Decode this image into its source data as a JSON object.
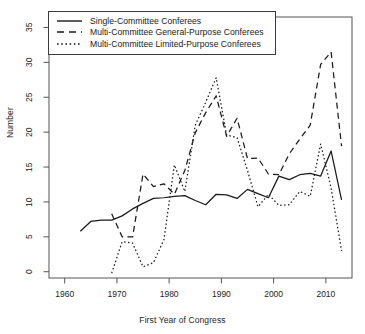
{
  "figure": {
    "title": "",
    "top_partial_text": "",
    "background_color": "#ffffff",
    "line_color": "#1a1a1a"
  },
  "axes": {
    "xlabel": "First Year of Congress",
    "ylabel": "Number",
    "xticks": [
      1960,
      1970,
      1980,
      1990,
      2000,
      2010
    ],
    "xtick_labels": [
      "1960",
      "1970",
      "1980",
      "1990",
      "2000",
      "2010"
    ],
    "yticks": [
      0,
      5,
      10,
      15,
      20,
      25,
      30,
      35
    ],
    "ytick_labels": [
      "0",
      "5",
      "10",
      "15",
      "20",
      "25",
      "30",
      "35"
    ],
    "xlim": [
      1957,
      2015
    ],
    "ylim": [
      -0.9,
      36.5
    ],
    "grid": false,
    "frame": true
  },
  "legend": {
    "position": "top-left",
    "border_color": "#3c3c3c",
    "entries": [
      {
        "label": "Single-Committee Conferees",
        "style": "solid",
        "key": "single-committee-key"
      },
      {
        "label": "Multi-Committee General-Purpose Conferees",
        "style": "dashed",
        "key": "general-purpose-key"
      },
      {
        "label": "Multi-Committee Limited-Purpose Conferees",
        "style": "dotted",
        "key": "limited-purpose-key"
      }
    ]
  },
  "chart_data": {
    "type": "line",
    "title": "",
    "xlabel": "First Year of Congress",
    "ylabel": "Number",
    "xlim": [
      1957,
      2015
    ],
    "ylim": [
      -0.9,
      36.5
    ],
    "grid": false,
    "legend_position": "top-left",
    "series": [
      {
        "name": "Single-Committee Conferees",
        "style": "solid",
        "x": [
          1963,
          1965,
          1967,
          1969,
          1971,
          1973,
          1975,
          1977,
          1979,
          1981,
          1983,
          1985,
          1987,
          1989,
          1991,
          1993,
          1995,
          1997,
          1999,
          2001,
          2003,
          2005,
          2007,
          2009,
          2011,
          2013
        ],
        "values": [
          5.8,
          7.2,
          7.4,
          7.4,
          8.0,
          9.0,
          9.8,
          10.5,
          10.6,
          10.8,
          10.9,
          10.2,
          9.6,
          11.1,
          11.0,
          10.5,
          11.8,
          11.2,
          10.6,
          13.7,
          13.2,
          13.9,
          14.1,
          13.7,
          17.3,
          10.3
        ]
      },
      {
        "name": "Multi-Committee General-Purpose Conferees",
        "style": "dashed",
        "x": [
          1969,
          1971,
          1973,
          1975,
          1977,
          1979,
          1981,
          1983,
          1985,
          1987,
          1989,
          1991,
          1993,
          1995,
          1997,
          1999,
          2001,
          2003,
          2005,
          2007,
          2009,
          2011,
          2013
        ],
        "values": [
          8.3,
          5.0,
          5.0,
          14.0,
          12.2,
          12.6,
          11.1,
          14.5,
          19.9,
          22.8,
          25.2,
          19.4,
          22.0,
          16.2,
          16.3,
          14.0,
          13.9,
          16.9,
          19.0,
          21.0,
          29.7,
          31.5,
          18.0
        ]
      },
      {
        "name": "Multi-Committee Limited-Purpose Conferees",
        "style": "dotted",
        "x": [
          1969,
          1971,
          1973,
          1975,
          1977,
          1979,
          1981,
          1983,
          1985,
          1987,
          1989,
          1991,
          1993,
          1995,
          1997,
          1999,
          2001,
          2003,
          2005,
          2007,
          2009,
          2011,
          2013
        ],
        "values": [
          -0.2,
          4.3,
          4.1,
          0.7,
          1.3,
          4.6,
          15.3,
          11.5,
          21.0,
          24.3,
          27.8,
          19.6,
          19.2,
          14.5,
          9.3,
          11.1,
          9.5,
          9.6,
          11.5,
          10.8,
          18.3,
          12.0,
          3.0
        ]
      }
    ]
  }
}
